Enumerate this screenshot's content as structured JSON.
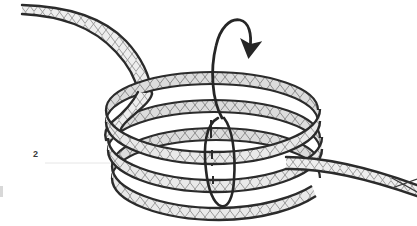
{
  "figure": {
    "label": "2",
    "caption_number": "2",
    "background_color": "#ffffff",
    "width": 417,
    "height": 226
  },
  "colors": {
    "outline": "#2b2b2b",
    "tube_fill": "#e9e9e9",
    "tube_fill_shaded": "#d8d8d8",
    "mesh_line": "#8c8c8c",
    "mesh_line_light": "#a8a8a8",
    "rule_line": "#e3e3e3",
    "label_text": "#3a3a3a",
    "arrow": "#262626",
    "edge_tick": "#d8d8d8"
  },
  "elements": {
    "coil": {
      "name": "braided tubular coil",
      "turns": 3,
      "description": "self-expanding braided mesh tube wound into a helix"
    },
    "lead_in_tail": {
      "name": "proximal tail",
      "position": "upper-left",
      "description": "straight braided tube segment entering the coil from upper left"
    },
    "exit_tail": {
      "name": "distal tail",
      "position": "lower-right",
      "description": "straight braided tube segment exiting the coil to the lower right"
    },
    "rotation_arrow": {
      "name": "rotation direction arrow",
      "description": "curved arrow at top of central axis indicating winding direction",
      "direction": "clockwise-down"
    },
    "axis_loop": {
      "name": "central axis loop",
      "description": "elongated closed loop encircling the coil central axis"
    },
    "axis_dashes": {
      "name": "central axis dashed line",
      "description": "short dashed vertical segments marking the hidden central axis"
    },
    "leader_rule": {
      "name": "label leader rule",
      "description": "faint horizontal rule extending right from the figure label"
    }
  },
  "icon_names": {
    "arrow": "curved-rotation-arrow-icon",
    "axis": "axis-line-icon",
    "label": "figure-number-label"
  }
}
